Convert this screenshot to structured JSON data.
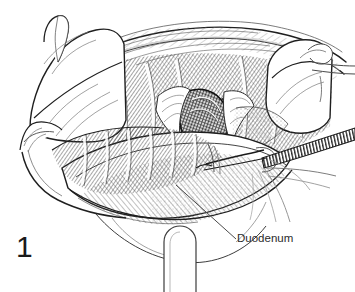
{
  "figure": {
    "number": "1",
    "kind": "surgical-line-drawing",
    "medium": "pen-and-ink hatching",
    "background_color": "#ffffff",
    "ink_color": "#1f1f1f",
    "hatch_color": "#4a4a4a",
    "light_ink_color": "#8a8a8a"
  },
  "annotations": [
    {
      "id": "duodenum",
      "label": "Duodenum",
      "leader_from_x": 176,
      "leader_from_y": 185,
      "leader_to_x": 236,
      "leader_to_y": 239,
      "label_x": 237,
      "label_y": 232
    }
  ],
  "scene": {
    "title": "Operative exposure of the duodenum",
    "structures": [
      {
        "name": "abdominal-wall-upper-flap",
        "description": "retracted upper abdominal wall with fascial layers"
      },
      {
        "name": "gauze-pad-left",
        "description": "folded surgical sponge packing the left field"
      },
      {
        "name": "gauze-pad-right",
        "description": "folded surgical sponge packing the right field"
      },
      {
        "name": "retractor-handle-right",
        "description": "thin retractor blade handle exiting right edge"
      },
      {
        "name": "retractor-blade-bottom",
        "description": "U-shaped retractor blade at lower midline"
      },
      {
        "name": "muscle-fascia-hatching",
        "description": "diagonally hatched muscle and fascia beds"
      },
      {
        "name": "duodenum-body",
        "description": "curved duodenal loop occupying the lower field"
      },
      {
        "name": "exposed-duct-dark",
        "description": "dark cross-hatched opened structure at center"
      },
      {
        "name": "forceps-instrument",
        "description": "serrated forceps entering from the right side"
      },
      {
        "name": "suture-threads",
        "description": "fine suture strands trailing to lower right"
      },
      {
        "name": "wound-edge-left",
        "description": "incised wound margin on the left"
      },
      {
        "name": "wound-edge-lower",
        "description": "incised wound margin along the lower border"
      }
    ]
  }
}
